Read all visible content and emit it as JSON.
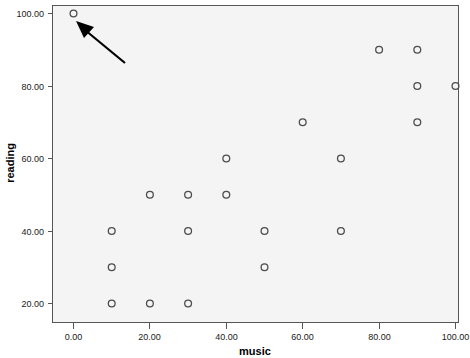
{
  "chart_data": {
    "type": "scatter",
    "title": "",
    "xlabel": "music",
    "ylabel": "reading",
    "xlim": [
      0,
      100
    ],
    "ylim": [
      20,
      100
    ],
    "grid": false,
    "legend": null,
    "marker_style": "open-circle",
    "x": [
      0,
      10,
      10,
      10,
      20,
      20,
      30,
      30,
      30,
      40,
      40,
      50,
      50,
      60,
      70,
      70,
      80,
      90,
      90,
      90,
      100
    ],
    "y": [
      100,
      40,
      30,
      20,
      50,
      20,
      50,
      40,
      20,
      60,
      50,
      40,
      30,
      70,
      60,
      40,
      90,
      90,
      80,
      70,
      80
    ],
    "points": [
      {
        "music": 0,
        "reading": 100
      },
      {
        "music": 10,
        "reading": 40
      },
      {
        "music": 10,
        "reading": 30
      },
      {
        "music": 10,
        "reading": 20
      },
      {
        "music": 20,
        "reading": 50
      },
      {
        "music": 20,
        "reading": 20
      },
      {
        "music": 30,
        "reading": 50
      },
      {
        "music": 30,
        "reading": 40
      },
      {
        "music": 30,
        "reading": 20
      },
      {
        "music": 40,
        "reading": 60
      },
      {
        "music": 40,
        "reading": 50
      },
      {
        "music": 50,
        "reading": 40
      },
      {
        "music": 50,
        "reading": 30
      },
      {
        "music": 60,
        "reading": 70
      },
      {
        "music": 70,
        "reading": 60
      },
      {
        "music": 70,
        "reading": 40
      },
      {
        "music": 80,
        "reading": 90
      },
      {
        "music": 90,
        "reading": 90
      },
      {
        "music": 90,
        "reading": 80
      },
      {
        "music": 90,
        "reading": 70
      },
      {
        "music": 100,
        "reading": 80
      }
    ],
    "xticks": [
      0,
      20,
      40,
      60,
      80,
      100
    ],
    "xticklabels": [
      "0.00",
      "20.00",
      "40.00",
      "60.00",
      "80.00",
      "100.00"
    ],
    "yticks": [
      20,
      40,
      60,
      80,
      100
    ],
    "yticklabels": [
      "20.00",
      "40.00",
      "60.00",
      "80.00",
      "100.00"
    ],
    "annotations": [
      {
        "type": "arrow",
        "points_to": {
          "music": 0,
          "reading": 100
        },
        "tail": {
          "music": 13.5,
          "reading": 89.5
        },
        "color": "#000000"
      }
    ],
    "colors": {
      "plot_background": "#f4f4f4",
      "page_background": "#ffffff",
      "marker_stroke": "#4d4d4d",
      "frame": "#555555",
      "text": "#000000"
    }
  }
}
